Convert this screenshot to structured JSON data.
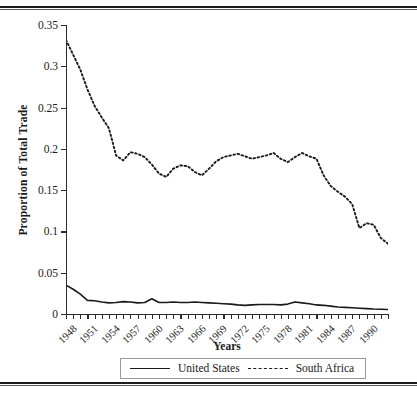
{
  "figure": {
    "ylabel": "Proportion of Total Trade",
    "xlabel": "Years",
    "legend": {
      "series": [
        {
          "label": "United States",
          "style": "solid"
        },
        {
          "label": "South Africa",
          "style": "dotted"
        }
      ]
    }
  },
  "chart_data": {
    "type": "line",
    "title": "",
    "xlabel": "Years",
    "ylabel": "Proportion of Total Trade",
    "xlim": [
      1948,
      1993
    ],
    "ylim": [
      0,
      0.35
    ],
    "ytick_labels": [
      "0",
      "0.05",
      "0.1",
      "0.15",
      "0.2",
      "0.25",
      "0.3",
      "0.35"
    ],
    "ytick_values": [
      0,
      0.05,
      0.1,
      0.15,
      0.2,
      0.25,
      0.3,
      0.35
    ],
    "xtick_labels": [
      "1948",
      "1951",
      "1954",
      "1957",
      "1960",
      "1963",
      "1966",
      "1969",
      "1972",
      "1975",
      "1978",
      "1981",
      "1984",
      "1987",
      "1990"
    ],
    "xtick_values": [
      1948,
      1951,
      1954,
      1957,
      1960,
      1963,
      1966,
      1969,
      1972,
      1975,
      1978,
      1981,
      1984,
      1987,
      1990
    ],
    "minor_xticks_every": 1,
    "grid": false,
    "legend_position": "below-axis",
    "x": [
      1948,
      1949,
      1950,
      1951,
      1952,
      1953,
      1954,
      1955,
      1956,
      1957,
      1958,
      1959,
      1960,
      1961,
      1962,
      1963,
      1964,
      1965,
      1966,
      1967,
      1968,
      1969,
      1970,
      1971,
      1972,
      1973,
      1974,
      1975,
      1976,
      1977,
      1978,
      1979,
      1980,
      1981,
      1982,
      1983,
      1984,
      1985,
      1986,
      1987,
      1988,
      1989,
      1990,
      1991,
      1992,
      1993
    ],
    "series": [
      {
        "name": "United States",
        "style": "solid",
        "values": [
          0.035,
          0.03,
          0.024,
          0.0165,
          0.016,
          0.0145,
          0.0135,
          0.014,
          0.015,
          0.0145,
          0.0135,
          0.014,
          0.0185,
          0.014,
          0.014,
          0.0145,
          0.014,
          0.014,
          0.0145,
          0.014,
          0.0135,
          0.013,
          0.0125,
          0.012,
          0.011,
          0.0105,
          0.011,
          0.0115,
          0.0115,
          0.0115,
          0.011,
          0.012,
          0.0145,
          0.0135,
          0.0125,
          0.011,
          0.0105,
          0.0095,
          0.0085,
          0.008,
          0.0075,
          0.007,
          0.0065,
          0.006,
          0.0058,
          0.0055
        ]
      },
      {
        "name": "South Africa",
        "style": "dotted",
        "values": [
          0.332,
          0.314,
          0.296,
          0.272,
          0.252,
          0.238,
          0.225,
          0.192,
          0.186,
          0.196,
          0.194,
          0.19,
          0.181,
          0.17,
          0.166,
          0.176,
          0.18,
          0.179,
          0.172,
          0.168,
          0.176,
          0.185,
          0.19,
          0.192,
          0.194,
          0.191,
          0.188,
          0.19,
          0.192,
          0.195,
          0.188,
          0.184,
          0.19,
          0.195,
          0.191,
          0.188,
          0.168,
          0.155,
          0.148,
          0.142,
          0.133,
          0.104,
          0.11,
          0.108,
          0.092,
          0.085
        ]
      }
    ]
  }
}
